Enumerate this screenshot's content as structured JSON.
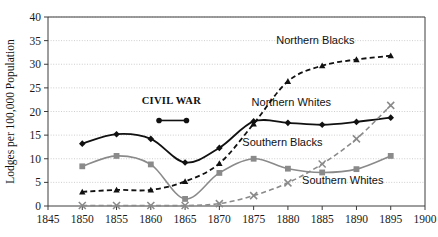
{
  "chart_data": {
    "type": "line",
    "title": "",
    "xlabel": "",
    "ylabel": "Lodges per 100,000 Population",
    "xlim": [
      1845,
      1900
    ],
    "ylim": [
      0,
      40
    ],
    "grid": true,
    "legend_position": "inline-labels",
    "x": [
      1850,
      1855,
      1860,
      1865,
      1870,
      1875,
      1880,
      1885,
      1890,
      1895
    ],
    "xticks": [
      "1845",
      "1850",
      "1855",
      "1860",
      "1865",
      "1870",
      "1875",
      "1880",
      "1885",
      "1890",
      "1895",
      "1900"
    ],
    "yticks": [
      "0",
      "5",
      "10",
      "15",
      "20",
      "25",
      "30",
      "35",
      "40"
    ],
    "series": [
      {
        "name": "Northern Whites",
        "color": "#111111",
        "style": "solid",
        "marker": "diamond",
        "values": [
          13.2,
          15.2,
          14.2,
          9.2,
          12.3,
          17.9,
          17.6,
          17.2,
          17.8,
          18.7
        ]
      },
      {
        "name": "Northern Blacks",
        "color": "#111111",
        "style": "dashed",
        "marker": "triangle",
        "values": [
          3.0,
          3.4,
          3.4,
          5.2,
          9.0,
          17.4,
          26.4,
          29.7,
          31.0,
          31.8
        ]
      },
      {
        "name": "Southern Blacks",
        "color": "#8a8a8a",
        "style": "solid",
        "marker": "square",
        "values": [
          8.4,
          10.6,
          8.8,
          1.5,
          7.0,
          10.0,
          7.9,
          7.1,
          7.8,
          10.6
        ]
      },
      {
        "name": "Southern Whites",
        "color": "#8a8a8a",
        "style": "dashed",
        "marker": "cross",
        "values": [
          0.1,
          0.1,
          0.1,
          0.1,
          0.5,
          2.2,
          4.9,
          8.9,
          14.2,
          21.3
        ]
      }
    ],
    "annotations": [
      {
        "name": "civil-war",
        "text": "CIVIL WAR",
        "text_x": 1863.0,
        "text_y": 21.6,
        "bar_x_start": 1861.2,
        "bar_x_end": 1865.2,
        "bar_y": 18.1
      }
    ],
    "series_labels": [
      {
        "name": "Northern Blacks",
        "x": 1884.0,
        "y": 34.3
      },
      {
        "name": "Northern Whites",
        "x": 1880.5,
        "y": 21.2
      },
      {
        "name": "Southern Blacks",
        "x": 1879.2,
        "y": 12.6
      },
      {
        "name": "Southern Whites",
        "x": 1888.0,
        "y": 4.6
      }
    ]
  }
}
